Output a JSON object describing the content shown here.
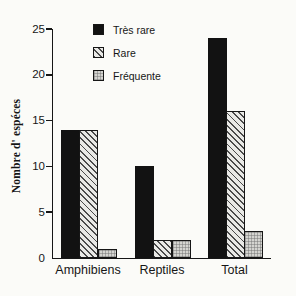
{
  "chart_data": {
    "type": "bar",
    "categories": [
      "Amphibiens",
      "Reptiles",
      "Total"
    ],
    "series": [
      {
        "name": "Très rare",
        "pattern": "solid",
        "color": "#121212",
        "values": [
          14,
          10,
          24
        ]
      },
      {
        "name": "Rare",
        "pattern": "diagonal-hatch",
        "color": "#e9e9e6",
        "values": [
          14,
          2,
          16
        ]
      },
      {
        "name": "Fréquente",
        "pattern": "stipple",
        "color": "#d4d4d0",
        "values": [
          1,
          2,
          3
        ]
      }
    ],
    "title": "",
    "xlabel": "",
    "ylabel": "Nombre d' espéces",
    "ylim": [
      0,
      25
    ],
    "yticks": [
      0,
      5,
      10,
      15,
      20,
      25
    ],
    "grid": false,
    "legend_position": "top-center"
  },
  "legend": {
    "items": [
      {
        "label": "Très rare"
      },
      {
        "label": "Rare"
      },
      {
        "label": "Fréquente"
      }
    ]
  },
  "colors": {
    "axis": "#161616",
    "background": "#fbfbf8",
    "bar_solid": "#121212"
  }
}
